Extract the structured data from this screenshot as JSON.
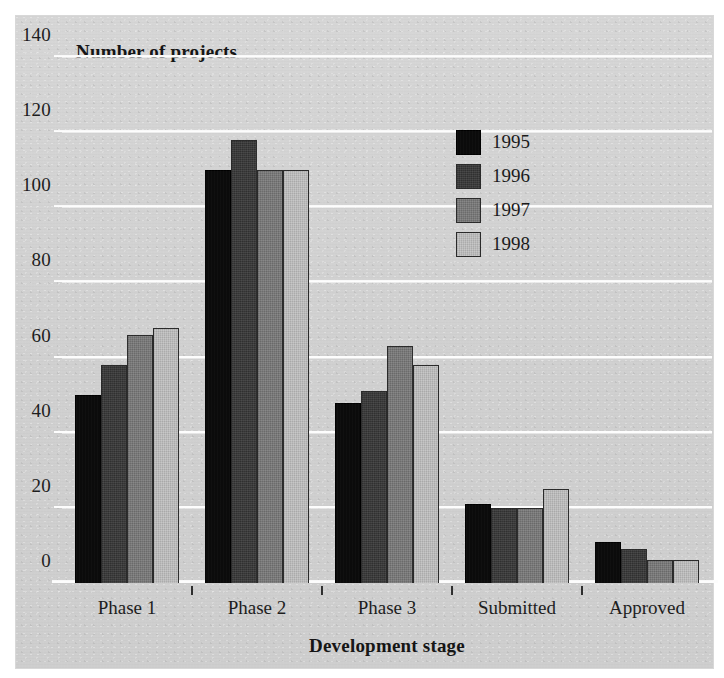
{
  "chart_data": {
    "type": "bar",
    "title": "Number of projects",
    "xlabel": "Development stage",
    "ylabel": "Number of projects",
    "categories": [
      "Phase 1",
      "Phase 2",
      "Phase 3",
      "Submitted",
      "Approved"
    ],
    "series": [
      {
        "name": "1995",
        "color": "#0b0b0b",
        "values": [
          50,
          110,
          48,
          21,
          11
        ]
      },
      {
        "name": "1996",
        "color": "#3a3a3a",
        "values": [
          58,
          118,
          51,
          20,
          9
        ]
      },
      {
        "name": "1997",
        "color": "#797979",
        "values": [
          66,
          110,
          63,
          20,
          6
        ]
      },
      {
        "name": "1998",
        "color": "#bcbcbc",
        "values": [
          68,
          110,
          58,
          25,
          6
        ]
      }
    ],
    "ylim": [
      0,
      140
    ],
    "yticks": [
      0,
      20,
      40,
      60,
      80,
      100,
      120,
      140
    ],
    "ytick_labels": [
      "0",
      "20",
      "40",
      "60",
      "80",
      "100",
      "120",
      "140"
    ],
    "grid": true,
    "gridline_color": "#fdfdfd",
    "legend_position": "upper-right-inside",
    "background_color": "#d3d3d3"
  },
  "figure": {
    "y_axis_title": "Number of projects",
    "x_axis_title": "Development stage"
  },
  "legend": {
    "entries": [
      {
        "label": "1995"
      },
      {
        "label": "1996"
      },
      {
        "label": "1997"
      },
      {
        "label": "1998"
      }
    ]
  }
}
